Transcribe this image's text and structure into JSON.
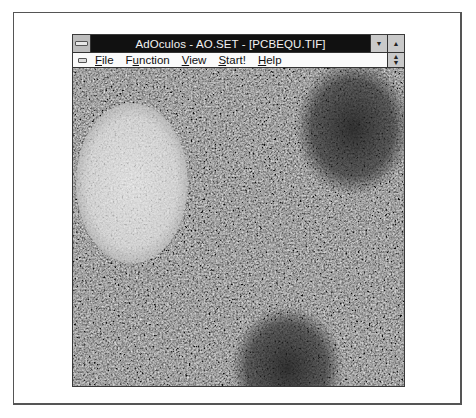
{
  "window": {
    "title": "AdOculos - AO.SET - [PCBEQU.TIF]",
    "app_name": "AdOculos",
    "settings_file": "AO.SET",
    "document": "PCBEQU.TIF",
    "controls": {
      "minimize_icon": "down-arrow-icon",
      "maximize_icon": "up-arrow-icon",
      "restore_icon": "up-down-arrow-icon",
      "system_menu_icon": "system-menu-bar-icon"
    }
  },
  "menu": {
    "items": [
      {
        "pre": "",
        "mnemonic": "F",
        "post": "ile",
        "label": "File"
      },
      {
        "pre": "F",
        "mnemonic": "u",
        "post": "nction",
        "label": "Function"
      },
      {
        "pre": "",
        "mnemonic": "V",
        "post": "iew",
        "label": "View"
      },
      {
        "pre": "",
        "mnemonic": "S",
        "post": "tart!",
        "label": "Start!"
      },
      {
        "pre": "",
        "mnemonic": "H",
        "post": "elp",
        "label": "Help"
      }
    ]
  },
  "image": {
    "description": "Grayscale noisy image with one bright ellipse (top-left) and two dark circular regions (top-right, bottom-center)",
    "background_gray": "#5a5a5a",
    "bright_blob_color": "#e4e4e4",
    "dark_blob_color": "#262626"
  },
  "colors": {
    "title_bar": "#111111",
    "title_text": "#f2f2f2",
    "menu_bg": "#fafafa",
    "button_face": "#c9c9c9"
  }
}
